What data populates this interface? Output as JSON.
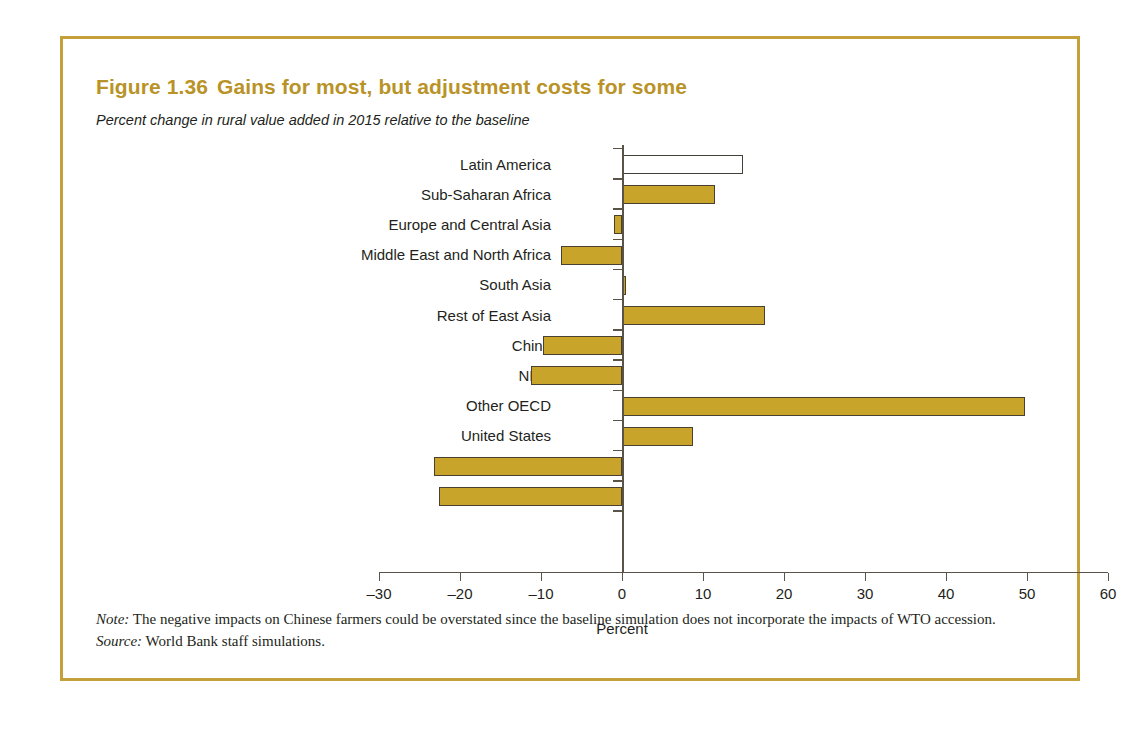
{
  "figure": {
    "number": "Figure 1.36",
    "title": "Gains for most, but adjustment costs for some",
    "subtitle": "Percent change in rural value added in 2015 relative to the baseline",
    "note_lead": "Note:",
    "note_text": "The negative impacts on Chinese farmers could be overstated since the baseline simulation does not incorporate the impacts of WTO accession.",
    "source_lead": "Source:",
    "source_text": "World Bank staff simulations.",
    "frame_color": "#c3a03a",
    "title_color": "#b99327",
    "bar_color": "#c8a42a",
    "bar_outline_color": "#4a4031",
    "highlight_bar_fill": "#ffffff"
  },
  "chart_data": {
    "type": "bar",
    "orientation": "horizontal",
    "title": "Gains for most, but adjustment costs for some",
    "subtitle": "Percent change in rural value added in 2015 relative to the baseline",
    "xlabel": "Percent",
    "ylabel": "",
    "xlim": [
      -30,
      60
    ],
    "xticks": [
      -30,
      -20,
      -10,
      0,
      10,
      20,
      30,
      40,
      50,
      60
    ],
    "xtick_labels": [
      "–30",
      "–20",
      "–10",
      "0",
      "10",
      "20",
      "30",
      "40",
      "50",
      "60"
    ],
    "grid": false,
    "legend": "none",
    "categories": [
      "Latin America",
      "Sub-Saharan Africa",
      "Europe and Central Asia",
      "Middle East and North Africa",
      "South Asia",
      "Rest of East Asia",
      "China",
      "NIEs",
      "Other OECD",
      "United States",
      "Japan",
      "Europe"
    ],
    "values": [
      14.9,
      11.5,
      -1.0,
      -7.5,
      0.5,
      17.7,
      -9.8,
      -11.2,
      49.7,
      8.8,
      -23.2,
      -22.6
    ],
    "highlighted": [
      "Latin America"
    ]
  }
}
